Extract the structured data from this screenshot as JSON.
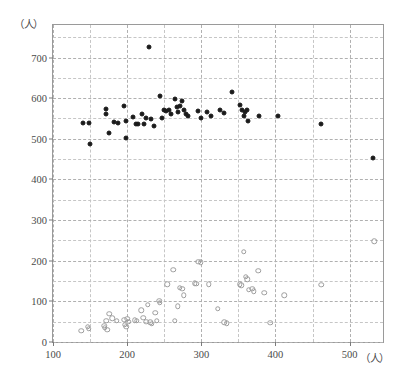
{
  "chart_data": {
    "type": "scatter",
    "title": "",
    "xlabel": "（人）",
    "ylabel": "（人）",
    "xlim": [
      100,
      545
    ],
    "ylim": [
      0,
      780
    ],
    "xticks": [
      100,
      200,
      300,
      400,
      500
    ],
    "yticks": [
      0,
      100,
      200,
      300,
      400,
      500,
      600,
      700
    ],
    "xtick_labels": [
      "100",
      "200",
      "300",
      "400",
      "500"
    ],
    "ytick_labels": [
      "0",
      "100",
      "200",
      "300",
      "400",
      "500",
      "600",
      "700"
    ],
    "grid": true,
    "grid_minor_step": 50,
    "legend": "",
    "series": [
      {
        "name": "filled-circles",
        "marker": "filled-circle",
        "color": "#1a1a1a",
        "points": [
          [
            141,
            540
          ],
          [
            148,
            538
          ],
          [
            150,
            486
          ],
          [
            172,
            573
          ],
          [
            172,
            560
          ],
          [
            175,
            515
          ],
          [
            182,
            541
          ],
          [
            188,
            540
          ],
          [
            196,
            580
          ],
          [
            198,
            545
          ],
          [
            199,
            501
          ],
          [
            208,
            553
          ],
          [
            212,
            537
          ],
          [
            214,
            536
          ],
          [
            220,
            560
          ],
          [
            223,
            537
          ],
          [
            226,
            552
          ],
          [
            229,
            725
          ],
          [
            232,
            549
          ],
          [
            236,
            531
          ],
          [
            244,
            605
          ],
          [
            247,
            551
          ],
          [
            250,
            570
          ],
          [
            253,
            568
          ],
          [
            257,
            572
          ],
          [
            259,
            560
          ],
          [
            265,
            598
          ],
          [
            267,
            578
          ],
          [
            268,
            565
          ],
          [
            271,
            580
          ],
          [
            274,
            592
          ],
          [
            276,
            570
          ],
          [
            279,
            562
          ],
          [
            282,
            556
          ],
          [
            296,
            568
          ],
          [
            300,
            552
          ],
          [
            308,
            565
          ],
          [
            313,
            556
          ],
          [
            325,
            570
          ],
          [
            330,
            563
          ],
          [
            341,
            615
          ],
          [
            352,
            582
          ],
          [
            355,
            570
          ],
          [
            357,
            556
          ],
          [
            359,
            566
          ],
          [
            361,
            572
          ],
          [
            363,
            545
          ],
          [
            378,
            556
          ],
          [
            404,
            555
          ],
          [
            462,
            537
          ],
          [
            532,
            453
          ]
        ]
      },
      {
        "name": "open-circles",
        "marker": "open-circle",
        "color": "#9d9d9d",
        "points": [
          [
            138,
            28
          ],
          [
            147,
            38
          ],
          [
            148,
            33
          ],
          [
            169,
            40
          ],
          [
            170,
            35
          ],
          [
            172,
            52
          ],
          [
            173,
            30
          ],
          [
            176,
            70
          ],
          [
            180,
            58
          ],
          [
            186,
            52
          ],
          [
            196,
            55
          ],
          [
            197,
            42
          ],
          [
            199,
            38
          ],
          [
            200,
            57
          ],
          [
            202,
            50
          ],
          [
            210,
            53
          ],
          [
            213,
            52
          ],
          [
            219,
            78
          ],
          [
            222,
            60
          ],
          [
            226,
            50
          ],
          [
            228,
            92
          ],
          [
            231,
            48
          ],
          [
            233,
            45
          ],
          [
            238,
            72
          ],
          [
            240,
            52
          ],
          [
            243,
            101
          ],
          [
            244,
            97
          ],
          [
            254,
            142
          ],
          [
            262,
            178
          ],
          [
            264,
            52
          ],
          [
            268,
            88
          ],
          [
            271,
            133
          ],
          [
            274,
            131
          ],
          [
            276,
            115
          ],
          [
            291,
            144
          ],
          [
            293,
            143
          ],
          [
            296,
            198
          ],
          [
            299,
            196
          ],
          [
            310,
            142
          ],
          [
            322,
            82
          ],
          [
            331,
            48
          ],
          [
            334,
            46
          ],
          [
            352,
            142
          ],
          [
            354,
            140
          ],
          [
            357,
            222
          ],
          [
            360,
            160
          ],
          [
            362,
            155
          ],
          [
            364,
            129
          ],
          [
            369,
            131
          ],
          [
            371,
            125
          ],
          [
            377,
            175
          ],
          [
            385,
            121
          ],
          [
            393,
            47
          ],
          [
            412,
            115
          ],
          [
            462,
            141
          ],
          [
            533,
            248
          ]
        ]
      }
    ]
  },
  "caption": ""
}
